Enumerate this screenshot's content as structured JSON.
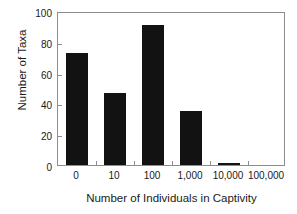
{
  "chart_data": {
    "type": "bar",
    "title": "",
    "xlabel": "Number of Individuals in Captivity",
    "ylabel": "Number of Taxa",
    "categories": [
      "0",
      "10",
      "100",
      "1,000",
      "10,000",
      "100,000"
    ],
    "values": [
      73,
      47,
      91,
      35,
      1,
      0
    ],
    "ylim": [
      0,
      100
    ],
    "yticks": [
      0,
      20,
      40,
      60,
      80,
      100
    ],
    "ytick_labels": [
      "0",
      "20",
      "40",
      "60",
      "80",
      "100"
    ],
    "grid": false,
    "legend": false,
    "legend_position": "none",
    "bar_color": "#121212",
    "axis_color": "#8d8d8d",
    "text_color": "#1a1a1a",
    "background": "#ffffff"
  }
}
